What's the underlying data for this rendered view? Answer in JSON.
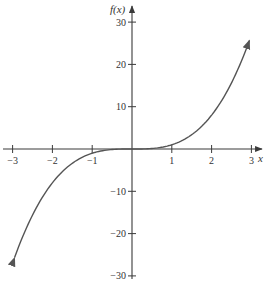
{
  "chart_data": {
    "type": "line",
    "title": "",
    "function": "f(x) = x^3",
    "xlabel": "x",
    "ylabel": "f(x)",
    "xlim": [
      -3,
      3
    ],
    "ylim": [
      -30,
      30
    ],
    "x_ticks": [
      -3,
      -2,
      -1,
      1,
      2,
      3
    ],
    "x_tick_labels": [
      "−3",
      "−2",
      "−1",
      "1",
      "2",
      "3"
    ],
    "y_ticks": [
      30,
      20,
      10,
      -10,
      -20,
      -30
    ],
    "y_tick_labels": [
      "30",
      "20",
      "10",
      "−10",
      "−20",
      "−30"
    ],
    "grid": false,
    "legend": null,
    "series": [
      {
        "name": "f(x)",
        "x": [
          -2.95,
          -2.5,
          -2,
          -1.5,
          -1,
          -0.5,
          0,
          0.5,
          1,
          1.5,
          2,
          2.5,
          2.95
        ],
        "y": [
          -25.7,
          -15.6,
          -8,
          -3.4,
          -1,
          -0.1,
          0,
          0.1,
          1,
          3.4,
          8,
          15.6,
          25.7
        ],
        "arrows_both_ends": true,
        "color": "#555555"
      }
    ]
  },
  "layout": {
    "origin_px": [
      132,
      149
    ],
    "px_per_x_unit": 39.8,
    "px_per_y_unit": 4.23,
    "axis_color": "#3a3a3a",
    "curve_color": "#555555"
  }
}
